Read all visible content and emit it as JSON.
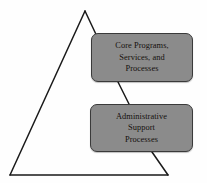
{
  "diagram": {
    "type": "pyramid-with-process-boxes",
    "background_color": "#fefefe",
    "shape": {
      "name": "triangle",
      "outline_color": "#1a1a1a",
      "fill": "none",
      "apex": "85,11",
      "bottom_left": "10,175",
      "bottom_right": "168,175"
    },
    "boxes": [
      {
        "id": "core-programs",
        "fill_color": "#8b8b8b",
        "border_color": "#3a3a3a",
        "lines": [
          "Core Programs,",
          "Services, and",
          "Processes"
        ]
      },
      {
        "id": "administrative-support",
        "fill_color": "#8b8b8b",
        "border_color": "#3a3a3a",
        "lines": [
          "Administrative",
          "Support",
          "Processes"
        ]
      }
    ]
  }
}
